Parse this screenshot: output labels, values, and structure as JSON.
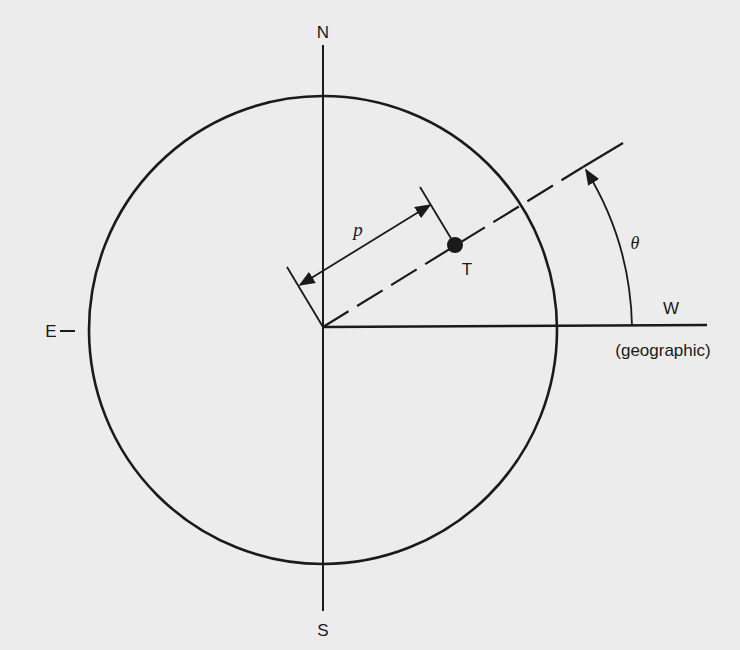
{
  "diagram": {
    "labels": {
      "north": "N",
      "south": "S",
      "east": "E",
      "west": "W",
      "west_note": "(geographic)",
      "target": "T",
      "distance": "p",
      "angle": "θ"
    },
    "geometry": {
      "circle_center": [
        323,
        330
      ],
      "circle_radius": 234,
      "origin": [
        323,
        327
      ],
      "target_point": [
        455,
        245
      ],
      "line_end": [
        583,
        167
      ],
      "angle_arc_radius": 309
    },
    "colors": {
      "background": "#ececec",
      "ink": "#1a1a1a"
    }
  }
}
